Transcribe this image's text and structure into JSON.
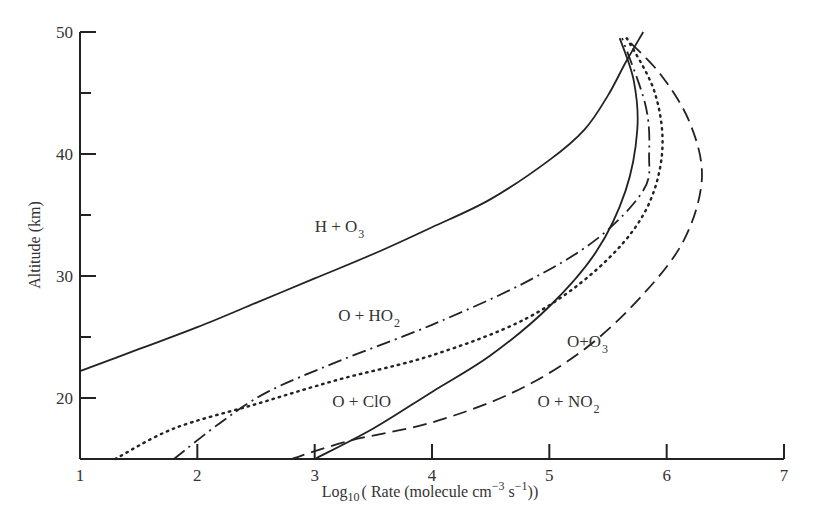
{
  "chart_data": {
    "type": "line",
    "title": "",
    "xlabel": "Log10 ( Rate (molecule cm^-3 s^-1))",
    "xlabel_parts": {
      "pre": "Log",
      "sub": "10",
      "mid": "( Rate (molecule cm",
      "sup1": "−3",
      "mid2": " s",
      "sup2": "−1",
      "post": "))"
    },
    "ylabel": "Altitude (km)",
    "xlim": [
      1,
      7
    ],
    "ylim": [
      15,
      50
    ],
    "x_ticks": [
      1,
      2,
      3,
      4,
      5,
      6,
      7
    ],
    "y_ticks_labeled": [
      20,
      30,
      40,
      50
    ],
    "y_ticks_minor": [
      25,
      35,
      45
    ],
    "grid": false,
    "legend": "inline labels",
    "series": [
      {
        "name": "H + O3",
        "label_base": "H + O",
        "label_sub": "3",
        "style": "solid",
        "label_pos": [
          3.0,
          33.6
        ],
        "x": [
          1.0,
          1.5,
          2.0,
          2.5,
          3.0,
          3.5,
          4.0,
          4.5,
          5.0,
          5.3,
          5.5,
          5.65,
          5.8
        ],
        "y": [
          22.2,
          24.0,
          25.8,
          27.8,
          29.8,
          31.8,
          34.0,
          36.3,
          39.5,
          42.0,
          44.8,
          47.5,
          50.0
        ]
      },
      {
        "name": "O + O3",
        "label_base": "O+O",
        "label_sub": "3",
        "style": "solid",
        "label_pos": [
          5.15,
          24.2
        ],
        "x": [
          3.0,
          3.5,
          4.0,
          4.5,
          5.0,
          5.4,
          5.65,
          5.75,
          5.72,
          5.6
        ],
        "y": [
          15.0,
          17.5,
          20.5,
          23.5,
          27.5,
          32.0,
          37.0,
          42.0,
          46.0,
          49.5
        ]
      },
      {
        "name": "O + HO2",
        "label_base": "O + HO",
        "label_sub": "2",
        "style": "dashdot",
        "label_pos": [
          3.2,
          26.3
        ],
        "x": [
          1.8,
          2.2,
          2.6,
          3.2,
          4.0,
          4.8,
          5.4,
          5.8,
          5.85,
          5.82,
          5.62
        ],
        "y": [
          15.0,
          18.0,
          20.5,
          23.0,
          26.0,
          29.5,
          33.0,
          37.0,
          40.0,
          44.0,
          49.5
        ]
      },
      {
        "name": "O + ClO",
        "label_base": "O + ClO",
        "label_sub": "",
        "style": "dotted",
        "label_pos": [
          3.15,
          19.3
        ],
        "x": [
          1.3,
          1.8,
          2.5,
          3.2,
          4.0,
          4.8,
          5.4,
          5.8,
          5.96,
          5.9,
          5.66
        ],
        "y": [
          15.0,
          17.5,
          19.5,
          21.5,
          23.5,
          26.5,
          30.5,
          35.0,
          40.0,
          45.0,
          49.5
        ]
      },
      {
        "name": "O + NO2",
        "label_base": "O + NO",
        "label_sub": "2",
        "style": "dashed",
        "label_pos": [
          4.9,
          19.3
        ],
        "x": [
          2.8,
          3.3,
          4.0,
          4.7,
          5.3,
          5.8,
          6.15,
          6.3,
          6.2,
          5.95,
          5.65
        ],
        "y": [
          15.0,
          16.5,
          18.0,
          20.5,
          24.0,
          28.5,
          33.0,
          38.0,
          42.5,
          46.5,
          49.5
        ]
      }
    ]
  },
  "colors": {
    "line": "#222222",
    "text": "#333333",
    "background": "#ffffff"
  }
}
